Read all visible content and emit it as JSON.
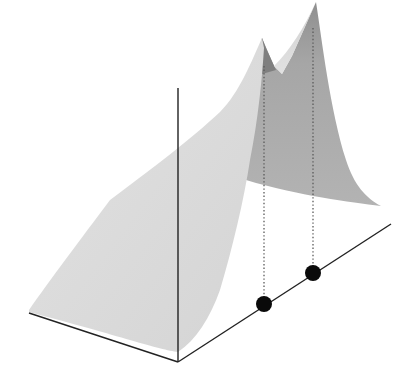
{
  "figure": {
    "description": "3D surface with two peaks projected onto a horizontal axis",
    "colors": {
      "background": "#ffffff",
      "front_surface": "#d9d9d9",
      "back_surface": "#a9a9a9",
      "back_surface_shadow": "#8c8c8c",
      "axis": "#222222",
      "dots": "#0a0a0a",
      "dotted_line": "#666666"
    },
    "axes": {
      "vertical": {
        "x1": 178,
        "y1": 88,
        "x2": 178,
        "y2": 362
      },
      "left": {
        "x1": 29,
        "y1": 313,
        "x2": 178,
        "y2": 362
      },
      "right": {
        "x1": 178,
        "y1": 362,
        "x2": 391,
        "y2": 224
      }
    },
    "peaks": [
      {
        "name": "peak-1",
        "tip_x": 262,
        "tip_y": 38,
        "projection_x": 264,
        "projection_y": 304
      },
      {
        "name": "peak-2",
        "tip_x": 316,
        "tip_y": 2,
        "projection_x": 313,
        "projection_y": 273
      }
    ],
    "dots": [
      {
        "cx": 264,
        "cy": 304,
        "r": 8
      },
      {
        "cx": 313,
        "cy": 273,
        "r": 8
      }
    ]
  }
}
